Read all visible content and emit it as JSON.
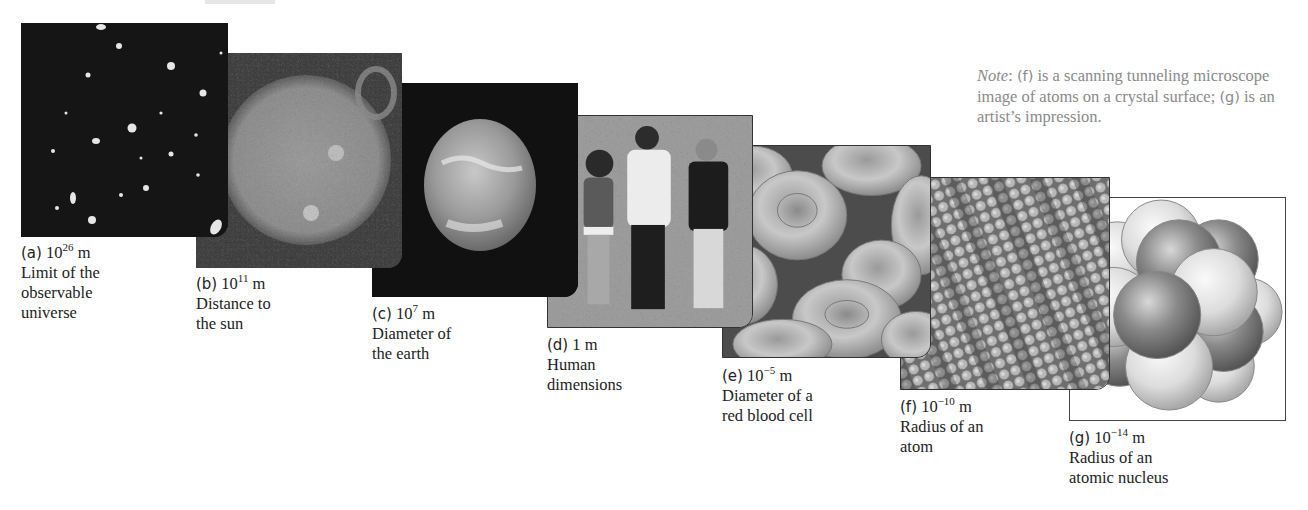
{
  "note": {
    "lead": "Note",
    "text_1": ": ",
    "mark_f": "(f)",
    "text_2": " is a scanning tunneling microscope image of atoms on a crystal surface; ",
    "mark_g": "(g)",
    "text_3": " is an artist’s impression."
  },
  "panels": [
    {
      "id": "a",
      "mark": "(a)",
      "base": "10",
      "exp": "26",
      "unit": " m",
      "line1": "Limit of the",
      "line2": "observable",
      "line3": "universe",
      "image": "deep-field-galaxies"
    },
    {
      "id": "b",
      "mark": "(b)",
      "base": "10",
      "exp": "11",
      "unit": " m",
      "line1": "Distance to",
      "line2": "the sun",
      "line3": "",
      "image": "sun"
    },
    {
      "id": "c",
      "mark": "(c)",
      "base": "10",
      "exp": "7",
      "unit": " m",
      "line1": "Diameter of",
      "line2": "the earth",
      "line3": "",
      "image": "earth"
    },
    {
      "id": "d",
      "mark": "(d)",
      "base": "1",
      "exp": "",
      "unit": " m",
      "line1": "Human",
      "line2": "dimensions",
      "line3": "",
      "image": "three-people"
    },
    {
      "id": "e",
      "mark": "(e)",
      "base": "10",
      "exp": "−5",
      "unit": " m",
      "line1": "Diameter of a",
      "line2": "red blood cell",
      "line3": "",
      "image": "red-blood-cells"
    },
    {
      "id": "f",
      "mark": "(f)",
      "base": "10",
      "exp": "−10",
      "unit": " m",
      "line1": "Radius of an",
      "line2": "atom",
      "line3": "",
      "image": "atoms-stm"
    },
    {
      "id": "g",
      "mark": "(g)",
      "base": "10",
      "exp": "−14",
      "unit": " m",
      "line1": "Radius of an",
      "line2": "atomic nucleus",
      "line3": "",
      "image": "atomic-nucleus"
    }
  ]
}
